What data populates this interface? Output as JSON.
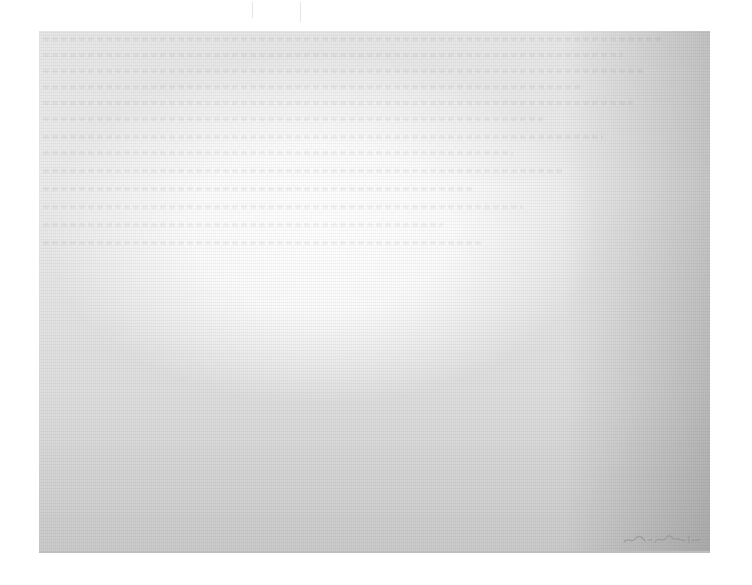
{
  "page": {
    "background_color": "#ffffff",
    "sheet_color": "#ececec",
    "signature": {
      "legible": false,
      "text": ""
    }
  }
}
